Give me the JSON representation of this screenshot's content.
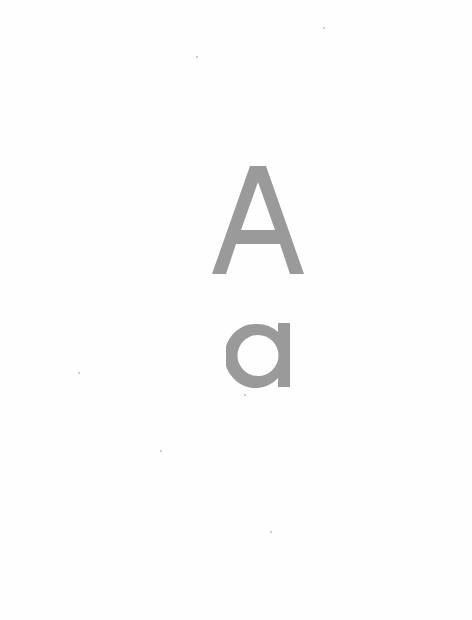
{
  "document": {
    "uppercase_letter": "A",
    "lowercase_letter": "a",
    "letter_color": "#9a9a9a",
    "background_color": "#fefefe"
  }
}
